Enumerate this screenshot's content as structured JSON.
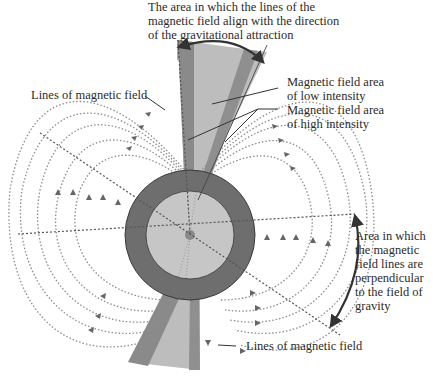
{
  "labels": {
    "top_title": [
      "The area in which the lines of the",
      "magnetic field align with the direction",
      "of the gravitational attraction"
    ],
    "low_intensity": [
      "Magnetic field area",
      "of low intensity"
    ],
    "high_intensity": [
      "Magnetic field area",
      "of high intensity"
    ],
    "lines_left": "Lines of magnetic field",
    "lines_bottom": "Lines of magnetic field",
    "perpendicular": [
      "Area in which",
      "the magnetic",
      "field lines are",
      "perpendicular",
      "to the field of",
      "gravity"
    ]
  },
  "colors": {
    "outer_ring": "#6e6e6e",
    "inner_disc": "#c6c6c6",
    "cone_light": "#bdbdbd",
    "cone_dark": "#8a8a8a",
    "field_line": "#8c8c8c",
    "axis_line": "#5a5a5a",
    "arrow": "#333333"
  }
}
